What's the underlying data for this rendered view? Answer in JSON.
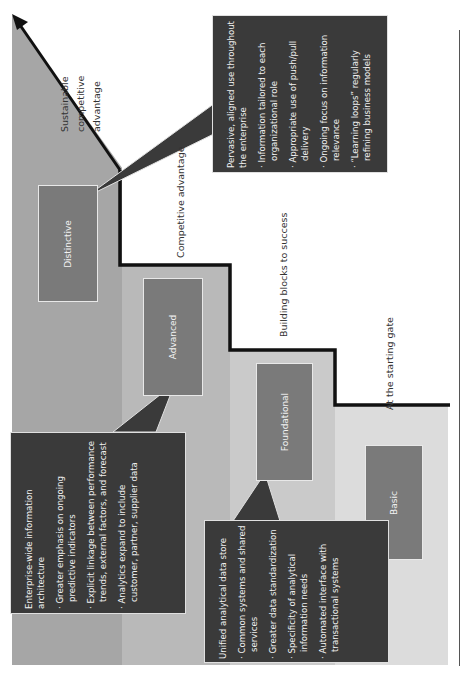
{
  "diagram": {
    "orientation": "rotated-90-ccw",
    "colors": {
      "distinctive_band": "#a6a6a6",
      "advanced_band": "#b8b8b8",
      "foundational_band": "#c9c9c9",
      "basic_band": "#dadada",
      "level_box": "#7a7a7a",
      "callout_bg": "#3a3a3a",
      "staircase_line": "#111111"
    },
    "levels": [
      {
        "name": "Distinctive",
        "stage_label": "Sustainable competitive advantage"
      },
      {
        "name": "Advanced",
        "stage_label": "Competitive advantage"
      },
      {
        "name": "Foundational",
        "stage_label": "Building blocks to success"
      },
      {
        "name": "Basic",
        "stage_label": "At the starting gate"
      }
    ],
    "stage_label_sustainable_lines": [
      "Sustainable",
      "competitive",
      "advantage"
    ],
    "callouts": {
      "distinctive": {
        "heading": "Pervasive, aligned use throughout the enterprise",
        "bullets": [
          "· Information tailored to each organizational role",
          "· Appropriate use of push/pull delivery",
          "· Ongoing focus on information relevance",
          "· “Learning loops” regularly refining business models"
        ]
      },
      "advanced": {
        "heading": "Enterprise-wide information architecture",
        "bullets": [
          "· Greater emphasis on ongoing predictive indicators",
          "· Explicit linkage between performance trends, external factors, and forecast",
          "· Analytics expand to include customer, partner, supplier data"
        ]
      },
      "foundational": {
        "heading": "Unified analytical data store",
        "bullets": [
          "· Common systems and shared services",
          "· Greater data standardization",
          "· Specificity of analytical information needs",
          "· Automated interface with transactional systems"
        ]
      }
    }
  }
}
